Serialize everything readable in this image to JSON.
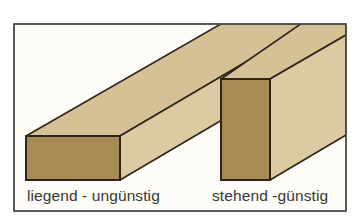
{
  "diagram": {
    "topic": "Board orientation (beam cross-section)",
    "labels": {
      "lying": "liegend - ungünstig",
      "standing": "stehend -günstig"
    },
    "colors": {
      "background": "#fdfcf6",
      "frame": "#4a4845",
      "wood_top": "#d6c197",
      "wood_side": "#d9c7a0",
      "wood_end": "#a88a55",
      "outline": "#2e2418"
    }
  }
}
